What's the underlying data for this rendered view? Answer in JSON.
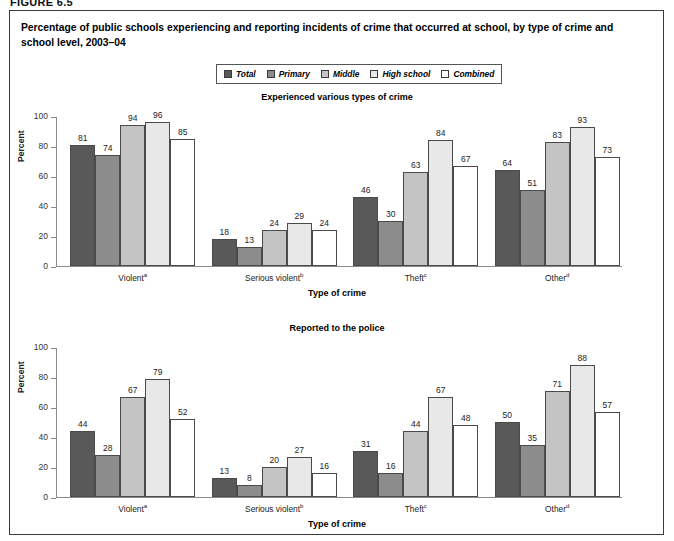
{
  "figure": {
    "label": "FIGURE 6.5",
    "title": "Percentage of public schools experiencing and reporting incidents of crime that occurred at school, by type of crime and school level, 2003–04"
  },
  "legend": {
    "items": [
      {
        "label": "Total",
        "color": "#595959"
      },
      {
        "label": "Primary",
        "color": "#8c8c8c"
      },
      {
        "label": "Middle",
        "color": "#c4c4c4"
      },
      {
        "label": "High school",
        "color": "#e8e8e8"
      },
      {
        "label": "Combined",
        "color": "#ffffff"
      }
    ]
  },
  "chart_data": [
    {
      "type": "bar",
      "title": "Experienced various types of crime",
      "xlabel": "Type of crime",
      "ylabel": "Percent",
      "ylim": [
        0,
        100
      ],
      "yticks": [
        0,
        20,
        40,
        60,
        80,
        100
      ],
      "grid": false,
      "legend_position": "top-center",
      "categories": [
        "Violent",
        "Serious violent",
        "Theft",
        "Other"
      ],
      "category_footnotes": [
        "a",
        "b",
        "c",
        "d"
      ],
      "series": [
        {
          "name": "Total",
          "color": "#595959",
          "values": [
            81,
            18,
            46,
            64
          ]
        },
        {
          "name": "Primary",
          "color": "#8c8c8c",
          "values": [
            74,
            13,
            30,
            51
          ]
        },
        {
          "name": "Middle",
          "color": "#c4c4c4",
          "values": [
            94,
            24,
            63,
            83
          ]
        },
        {
          "name": "High school",
          "color": "#e8e8e8",
          "values": [
            96,
            29,
            84,
            93
          ]
        },
        {
          "name": "Combined",
          "color": "#ffffff",
          "values": [
            85,
            24,
            67,
            73
          ]
        }
      ]
    },
    {
      "type": "bar",
      "title": "Reported to the police",
      "xlabel": "Type of crime",
      "ylabel": "Percent",
      "ylim": [
        0,
        100
      ],
      "yticks": [
        0,
        20,
        40,
        60,
        80,
        100
      ],
      "grid": false,
      "legend_position": "top-center",
      "categories": [
        "Violent",
        "Serious violent",
        "Theft",
        "Other"
      ],
      "category_footnotes": [
        "a",
        "b",
        "c",
        "d"
      ],
      "series": [
        {
          "name": "Total",
          "color": "#595959",
          "values": [
            44,
            13,
            31,
            50
          ]
        },
        {
          "name": "Primary",
          "color": "#8c8c8c",
          "values": [
            28,
            8,
            16,
            35
          ]
        },
        {
          "name": "Middle",
          "color": "#c4c4c4",
          "values": [
            67,
            20,
            44,
            71
          ]
        },
        {
          "name": "High school",
          "color": "#e8e8e8",
          "values": [
            79,
            27,
            67,
            88
          ]
        },
        {
          "name": "Combined",
          "color": "#ffffff",
          "values": [
            52,
            16,
            48,
            57
          ]
        }
      ]
    }
  ]
}
